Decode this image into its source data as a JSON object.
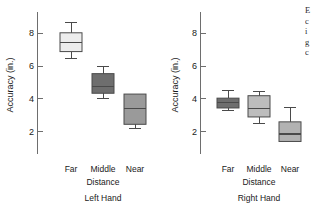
{
  "figure": {
    "ylabel": "Accuracy (in.)",
    "y_ticks": [
      "2",
      "4",
      "6",
      "8"
    ],
    "group_axis_label": "Distance",
    "categories": [
      "Far",
      "Middle",
      "Near"
    ]
  },
  "panels": [
    {
      "title": "Left Hand"
    },
    {
      "title": "Right Hand"
    }
  ],
  "side_text": {
    "line1": "E",
    "line2": "c",
    "line3": "i",
    "line4": "g",
    "line5": "c"
  },
  "chart_data": {
    "type": "box",
    "title": "",
    "xlabel": "Distance",
    "ylabel": "Accuracy (in.)",
    "ylim": [
      1.0,
      9.2
    ],
    "yticks": [
      2,
      4,
      6,
      8
    ],
    "grid": false,
    "legend": "none",
    "panels": [
      {
        "name": "Left Hand",
        "categories": [
          "Far",
          "Middle",
          "Near"
        ],
        "boxes": [
          {
            "category": "Far",
            "whisker_low": 6.5,
            "q1": 6.9,
            "median": 7.45,
            "q3": 8.05,
            "whisker_high": 8.65,
            "fill": "#ededed"
          },
          {
            "category": "Middle",
            "whisker_low": 4.0,
            "q1": 4.35,
            "median": 4.75,
            "q3": 5.55,
            "whisker_high": 6.0,
            "fill": "#6e6e6e"
          },
          {
            "category": "Near",
            "whisker_low": 2.2,
            "q1": 2.45,
            "median": 3.4,
            "q3": 4.3,
            "whisker_high": 4.3,
            "fill": "#9a9a9a"
          }
        ]
      },
      {
        "name": "Right Hand",
        "categories": [
          "Far",
          "Middle",
          "Near"
        ],
        "boxes": [
          {
            "category": "Far",
            "whisker_low": 3.3,
            "q1": 3.45,
            "median": 3.8,
            "q3": 4.05,
            "whisker_high": 4.5,
            "fill": "#6e6e6e"
          },
          {
            "category": "Middle",
            "whisker_low": 2.5,
            "q1": 2.9,
            "median": 3.4,
            "q3": 4.2,
            "whisker_high": 4.45,
            "fill": "#bdbdbd"
          },
          {
            "category": "Near",
            "whisker_low": 1.4,
            "q1": 1.4,
            "median": 1.85,
            "q3": 2.6,
            "whisker_high": 3.5,
            "fill": "#b2b2b2"
          }
        ]
      }
    ]
  }
}
